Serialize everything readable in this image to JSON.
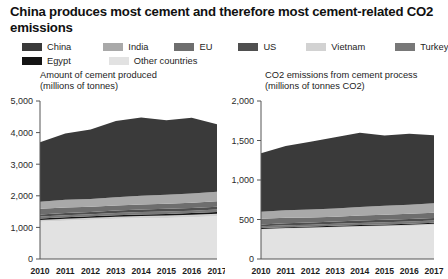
{
  "headline": "China produces most cement and therefore most cement-related CO2 emissions",
  "colors": {
    "china": "#3a3a3a",
    "india": "#a9a9a9",
    "eu": "#6e6e6e",
    "us": "#4f4f4f",
    "vietnam": "#d2d2d2",
    "turkey": "#787878",
    "egypt": "#141414",
    "other": "#e2e2e2",
    "axis": "#555555",
    "text": "#1d1d1d"
  },
  "legend": {
    "rows": [
      [
        {
          "label": "China",
          "key": "china"
        },
        {
          "label": "India",
          "key": "india"
        },
        {
          "label": "EU",
          "key": "eu"
        },
        {
          "label": "US",
          "key": "us"
        },
        {
          "label": "Vietnam",
          "key": "vietnam"
        },
        {
          "label": "Turkey",
          "key": "turkey"
        }
      ],
      [
        {
          "label": "Egypt",
          "key": "egypt"
        },
        {
          "label": "Other countries",
          "key": "other"
        }
      ]
    ]
  },
  "chart_data": [
    {
      "id": "cement-production",
      "type": "area",
      "title": "Amount of cement produced\n(millions of tonnes)",
      "xlabel": "",
      "ylabel": "millions of tonnes",
      "x": [
        2010,
        2011,
        2012,
        2013,
        2014,
        2015,
        2016,
        2017
      ],
      "categories": [
        "2010",
        "2011",
        "2012",
        "2013",
        "2014",
        "2015",
        "2016",
        "2017"
      ],
      "ylim": [
        0,
        5000
      ],
      "yticks": [
        0,
        1000,
        2000,
        3000,
        4000,
        5000
      ],
      "ytick_labels": [
        "0",
        "1,000",
        "2,000",
        "3,000",
        "4,000",
        "5,000"
      ],
      "grid": false,
      "legend_position": "top",
      "stack_order": [
        "other",
        "vietnam",
        "egypt",
        "turkey",
        "us",
        "eu",
        "india",
        "china"
      ],
      "series": [
        {
          "name": "Other countries",
          "key": "other",
          "values": [
            1180,
            1210,
            1240,
            1270,
            1290,
            1300,
            1320,
            1350
          ]
        },
        {
          "name": "Vietnam",
          "key": "vietnam",
          "values": [
            55,
            60,
            62,
            65,
            70,
            74,
            80,
            85
          ]
        },
        {
          "name": "Egypt",
          "key": "egypt",
          "values": [
            48,
            50,
            50,
            50,
            50,
            52,
            52,
            52
          ]
        },
        {
          "name": "Turkey",
          "key": "turkey",
          "values": [
            63,
            65,
            64,
            72,
            75,
            77,
            78,
            82
          ]
        },
        {
          "name": "US",
          "key": "us",
          "values": [
            66,
            69,
            74,
            78,
            83,
            85,
            86,
            87
          ]
        },
        {
          "name": "EU",
          "key": "eu",
          "values": [
            180,
            178,
            160,
            156,
            160,
            164,
            166,
            170
          ]
        },
        {
          "name": "India",
          "key": "india",
          "values": [
            220,
            240,
            250,
            260,
            270,
            280,
            290,
            300
          ]
        },
        {
          "name": "China",
          "key": "china",
          "values": [
            1880,
            2100,
            2200,
            2420,
            2480,
            2360,
            2400,
            2140
          ]
        }
      ],
      "totals": [
        3472,
        3772,
        3900,
        4171,
        4278,
        4192,
        4272,
        4266
      ]
    },
    {
      "id": "cement-co2",
      "type": "area",
      "title": "CO2 emissions from cement process\n(millions of tonnes CO2)",
      "xlabel": "",
      "ylabel": "millions of tonnes CO2",
      "x": [
        2010,
        2011,
        2012,
        2013,
        2014,
        2015,
        2016,
        2017
      ],
      "categories": [
        "2010",
        "2011",
        "2012",
        "2013",
        "2014",
        "2015",
        "2016",
        "2017"
      ],
      "ylim": [
        0,
        2000
      ],
      "yticks": [
        0,
        500,
        1000,
        1500,
        2000
      ],
      "ytick_labels": [
        "0",
        "500",
        "1,000",
        "1,500",
        "2,000"
      ],
      "grid": false,
      "legend_position": "top",
      "stack_order": [
        "other",
        "vietnam",
        "egypt",
        "turkey",
        "us",
        "eu",
        "india",
        "china"
      ],
      "series": [
        {
          "name": "Other countries",
          "key": "other",
          "values": [
            370,
            380,
            388,
            396,
            404,
            410,
            418,
            428
          ]
        },
        {
          "name": "Vietnam",
          "key": "vietnam",
          "values": [
            10,
            11,
            12,
            13,
            14,
            15,
            16,
            17
          ]
        },
        {
          "name": "Egypt",
          "key": "egypt",
          "values": [
            12,
            12,
            12,
            12,
            12,
            13,
            13,
            13
          ]
        },
        {
          "name": "Turkey",
          "key": "turkey",
          "values": [
            22,
            23,
            23,
            25,
            26,
            27,
            28,
            29
          ]
        },
        {
          "name": "US",
          "key": "us",
          "values": [
            24,
            25,
            27,
            28,
            30,
            31,
            31,
            32
          ]
        },
        {
          "name": "EU",
          "key": "eu",
          "values": [
            72,
            71,
            64,
            62,
            64,
            65,
            66,
            68
          ]
        },
        {
          "name": "India",
          "key": "india",
          "values": [
            88,
            96,
            100,
            104,
            108,
            112,
            116,
            120
          ]
        },
        {
          "name": "China",
          "key": "china",
          "values": [
            742,
            812,
            858,
            900,
            940,
            890,
            898,
            858
          ]
        }
      ],
      "totals": [
        1340,
        1430,
        1484,
        1540,
        1598,
        1563,
        1586,
        1565
      ]
    }
  ]
}
